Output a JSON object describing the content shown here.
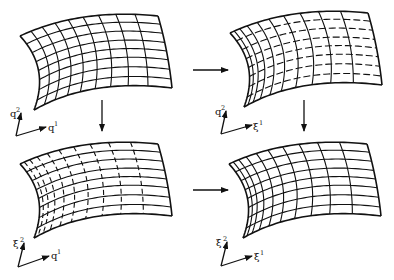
{
  "diagram": {
    "colors": {
      "stroke": "#111111",
      "background": "#ffffff"
    },
    "panels": [
      {
        "id": "top-left",
        "axis_vertical": {
          "base": "q",
          "sup": "2"
        },
        "axis_horizontal": {
          "base": "q",
          "sup": "1"
        },
        "vertical_lines": "solid",
        "horizontal_lines": "solid"
      },
      {
        "id": "top-right",
        "axis_vertical": {
          "base": "q",
          "sup": "2"
        },
        "axis_horizontal": {
          "base": "ξ",
          "sup": "1"
        },
        "vertical_lines": "solid",
        "horizontal_lines": "dashed"
      },
      {
        "id": "bottom-left",
        "axis_vertical": {
          "base": "ξ",
          "sup": "2"
        },
        "axis_horizontal": {
          "base": "q",
          "sup": "1"
        },
        "vertical_lines": "dashed",
        "horizontal_lines": "solid"
      },
      {
        "id": "bottom-right",
        "axis_vertical": {
          "base": "ξ",
          "sup": "2"
        },
        "axis_horizontal": {
          "base": "ξ",
          "sup": "1"
        },
        "vertical_lines": "solid",
        "horizontal_lines": "solid"
      }
    ],
    "arrows": [
      {
        "from": "top-left",
        "to": "top-right",
        "direction": "right"
      },
      {
        "from": "top-left",
        "to": "bottom-left",
        "direction": "down"
      },
      {
        "from": "top-right",
        "to": "bottom-right",
        "direction": "down"
      },
      {
        "from": "bottom-left",
        "to": "bottom-right",
        "direction": "right"
      }
    ]
  }
}
